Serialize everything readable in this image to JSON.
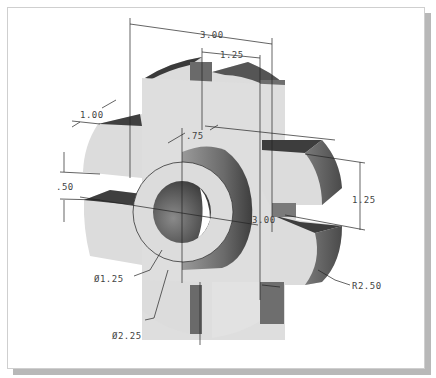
{
  "figure": {
    "colors": {
      "face_light": "#dcdcdc",
      "face_mid": "#8a8a8a",
      "face_dark": "#4f4f4f",
      "top_dark": "#3c3c3c",
      "line": "#222222",
      "text": "#444444",
      "shadow": "#b8b8b8",
      "frame_border": "#cfcfcf"
    }
  },
  "dimensions": {
    "overall_width": "3.00",
    "slot_spacing": "1.25",
    "lobe_thickness": "1.00",
    "hub_offset": ".75",
    "slot_width": ".50",
    "right_slot_spacing": "1.25",
    "center_width": "3.00",
    "bore_diameter": "Ø1.25",
    "hub_diameter": "Ø2.25",
    "outer_radius": "R2.50"
  }
}
